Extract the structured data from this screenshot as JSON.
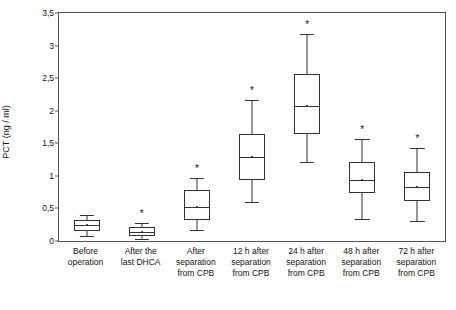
{
  "chart_data": {
    "type": "box",
    "title": "",
    "xlabel": "",
    "ylabel": "PCT (ng / ml)",
    "ylim": [
      0,
      3.5
    ],
    "ytick_labels": [
      "0",
      "0,5",
      "1",
      "1,5",
      "2",
      "2,5",
      "3",
      "3,5"
    ],
    "ytick_values": [
      0,
      0.5,
      1,
      1.5,
      2,
      2.5,
      3,
      3.5
    ],
    "grid": false,
    "legend": "none",
    "significance_marker": "*",
    "categories": [
      "Before\noperation",
      "After the\nlast DHCA",
      "After\nseparation\nfrom CPB",
      "12 h after\nseparation\nfrom CPB",
      "24 h after\nseparation\nfrom CPB",
      "48 h after\nseparation\nfrom CPB",
      "72 h after\nseparation\nfrom CPB"
    ],
    "boxes": [
      {
        "label": "Before operation",
        "whisker_low": 0.08,
        "q1": 0.16,
        "median": 0.25,
        "q3": 0.33,
        "whisker_high": 0.4,
        "mean": 0.25,
        "significant": false
      },
      {
        "label": "After the last DHCA",
        "whisker_low": 0.03,
        "q1": 0.08,
        "median": 0.14,
        "q3": 0.21,
        "whisker_high": 0.27,
        "mean": 0.14,
        "significant": true
      },
      {
        "label": "After separation from CPB",
        "whisker_low": 0.17,
        "q1": 0.33,
        "median": 0.52,
        "q3": 0.78,
        "whisker_high": 0.96,
        "mean": 0.52,
        "significant": true
      },
      {
        "label": "12 h after separation from CPB",
        "whisker_low": 0.6,
        "q1": 0.93,
        "median": 1.29,
        "q3": 1.64,
        "whisker_high": 2.17,
        "mean": 1.29,
        "significant": true
      },
      {
        "label": "24 h after separation from CPB",
        "whisker_low": 1.22,
        "q1": 1.65,
        "median": 2.07,
        "q3": 2.57,
        "whisker_high": 3.17,
        "mean": 2.07,
        "significant": true
      },
      {
        "label": "48 h after separation from CPB",
        "whisker_low": 0.34,
        "q1": 0.73,
        "median": 0.94,
        "q3": 1.22,
        "whisker_high": 1.57,
        "mean": 0.94,
        "significant": true
      },
      {
        "label": "72 h after separation from CPB",
        "whisker_low": 0.3,
        "q1": 0.62,
        "median": 0.83,
        "q3": 1.06,
        "whisker_high": 1.43,
        "mean": 0.83,
        "significant": true
      }
    ]
  }
}
